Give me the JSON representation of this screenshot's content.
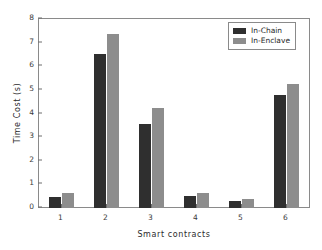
{
  "chart_data": {
    "type": "bar",
    "title": "",
    "xlabel": "Smart contracts",
    "ylabel": "Time Cost (s)",
    "categories": [
      "1",
      "2",
      "3",
      "4",
      "5",
      "6"
    ],
    "series": [
      {
        "name": "In-Chain",
        "color": "#2f2f2f",
        "values": [
          0.47,
          6.5,
          3.55,
          0.5,
          0.3,
          4.8
        ]
      },
      {
        "name": "In-Enclave",
        "color": "#8d8d8d",
        "values": [
          0.62,
          7.35,
          4.22,
          0.62,
          0.4,
          5.25
        ]
      }
    ],
    "ylim": [
      0,
      8
    ],
    "yticks": [
      0,
      1,
      2,
      3,
      4,
      5,
      6,
      7,
      8
    ],
    "ytick_labels": [
      "0",
      "1",
      "2",
      "3",
      "4",
      "5",
      "6",
      "7",
      "8"
    ],
    "grid": false,
    "legend_position": "top-right"
  },
  "axes": {
    "y_title": "Time Cost (s)",
    "x_title": "Smart contracts"
  },
  "legend": {
    "entries": [
      {
        "label": "In-Chain"
      },
      {
        "label": "In-Enclave"
      }
    ]
  }
}
